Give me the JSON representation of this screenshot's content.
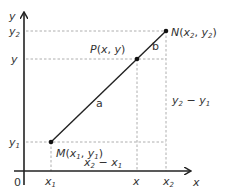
{
  "diagram": {
    "title": "",
    "axes": {
      "x_label": "x",
      "y_label": "y",
      "origin_label": "0"
    },
    "y_ticks": [
      {
        "base": "y",
        "sub": "2"
      },
      {
        "base": "y",
        "sub": ""
      },
      {
        "base": "y",
        "sub": "1"
      }
    ],
    "x_ticks": [
      {
        "base": "x",
        "sub": "1"
      },
      {
        "base": "x",
        "sub": ""
      },
      {
        "base": "x",
        "sub": "2"
      }
    ],
    "points": {
      "M": {
        "name": "M",
        "x": "x",
        "x_sub": "1",
        "y": "y",
        "y_sub": "1"
      },
      "P": {
        "name": "P",
        "x": "x",
        "y": "y"
      },
      "N": {
        "name": "N",
        "x": "x",
        "x_sub": "2",
        "y": "y",
        "y_sub": "2"
      }
    },
    "segment_labels": {
      "a": "a",
      "b": "b"
    },
    "differences": {
      "dx": {
        "left": "x",
        "left_sub": "2",
        "op": " − ",
        "right": "x",
        "right_sub": "1"
      },
      "dy": {
        "left": "y",
        "left_sub": "2",
        "op": " − ",
        "right": "y",
        "right_sub": "1"
      }
    },
    "colors": {
      "axis": "#222222",
      "dash": "#9a9a9a",
      "text": "#333333"
    }
  }
}
